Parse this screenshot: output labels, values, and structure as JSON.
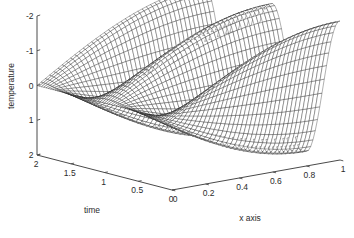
{
  "figure": {
    "background_color": "#ffffff",
    "line_color": "#141414",
    "axis_color": "#4a4a4a",
    "text_color": "#2b2b2b",
    "width": 354,
    "height": 238
  },
  "chart_data": {
    "type": "surface",
    "render": "mesh",
    "title": "",
    "xlabel": "x axis",
    "ylabel": "time",
    "zlabel": "temperature",
    "xlim": [
      0,
      1
    ],
    "ylim": [
      0,
      2
    ],
    "zlim": [
      -2,
      2
    ],
    "xticks": [
      0,
      0.2,
      0.4,
      0.6,
      0.8,
      1
    ],
    "xticklabels": [
      "0",
      "0.2",
      "0.4",
      "0.6",
      "0.8",
      "1"
    ],
    "yticks": [
      0,
      0.5,
      1,
      1.5,
      2
    ],
    "yticklabels": [
      "0",
      "0.5",
      "1",
      "1.5",
      "2"
    ],
    "zticks": [
      -2,
      -1,
      0,
      1,
      2
    ],
    "zticklabels": [
      "-2",
      "-1",
      "0",
      "1",
      "2"
    ],
    "grid": false,
    "legend": false,
    "colormap": "none",
    "mesh_nx": 41,
    "mesh_ny": 61,
    "surface_function": "z = 2*sin(pi*x)*cos(2*pi*t)",
    "amplitude": 2.0,
    "x_mode_halfwaves": 1,
    "t_periods": 2,
    "ridge_count": 4,
    "view_azimuth": -37.5,
    "view_elevation": 30
  },
  "axes": {
    "z_axis_name": "temperature",
    "y_axis_name": "time",
    "x_axis_name": "x axis",
    "z_tick_text": [
      "2",
      "1",
      "0",
      "-1",
      "-2"
    ],
    "y_tick_text": [
      "2",
      "1.5",
      "1",
      "0.5",
      "0"
    ],
    "x_tick_text": [
      "0",
      "0.2",
      "0.4",
      "0.6",
      "0.8",
      "1"
    ],
    "origin_corner_label_left": "2",
    "origin_corner_label_right": "0"
  }
}
